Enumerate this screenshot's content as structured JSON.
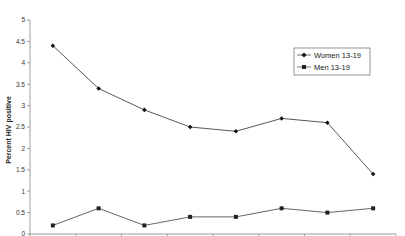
{
  "chart_data": {
    "type": "line",
    "title": "",
    "xlabel": "",
    "ylabel": "Percent HIV positive",
    "ylim": [
      0,
      5
    ],
    "yticks": [
      0,
      0.5,
      1,
      1.5,
      2,
      2.5,
      3,
      3.5,
      4,
      4.5,
      5
    ],
    "ytick_labels": [
      "0",
      "0.5",
      "1",
      "1.5",
      "2",
      "2.5",
      "3",
      "3.5",
      "4",
      "4.5",
      "5"
    ],
    "categories": [
      "1",
      "2",
      "3",
      "4",
      "5",
      "6",
      "7",
      "8"
    ],
    "category_labels_visible": false,
    "grid": false,
    "legend_position": "upper right",
    "series": [
      {
        "name": "Women 13-19",
        "marker": "diamond",
        "color": "#444444",
        "marker_color": "#111111",
        "values": [
          4.4,
          3.4,
          2.9,
          2.5,
          2.4,
          2.7,
          2.6,
          1.4
        ]
      },
      {
        "name": "Men 13-19",
        "marker": "square",
        "color": "#555555",
        "marker_color": "#222222",
        "values": [
          0.2,
          0.6,
          0.2,
          0.4,
          0.4,
          0.6,
          0.5,
          0.6
        ]
      }
    ]
  },
  "axis": {
    "y_title": "Percent HIV positive"
  },
  "legend": {
    "items": [
      {
        "label": "Women 13-19",
        "marker": "diamond"
      },
      {
        "label": "Men 13-19",
        "marker": "square"
      }
    ]
  }
}
